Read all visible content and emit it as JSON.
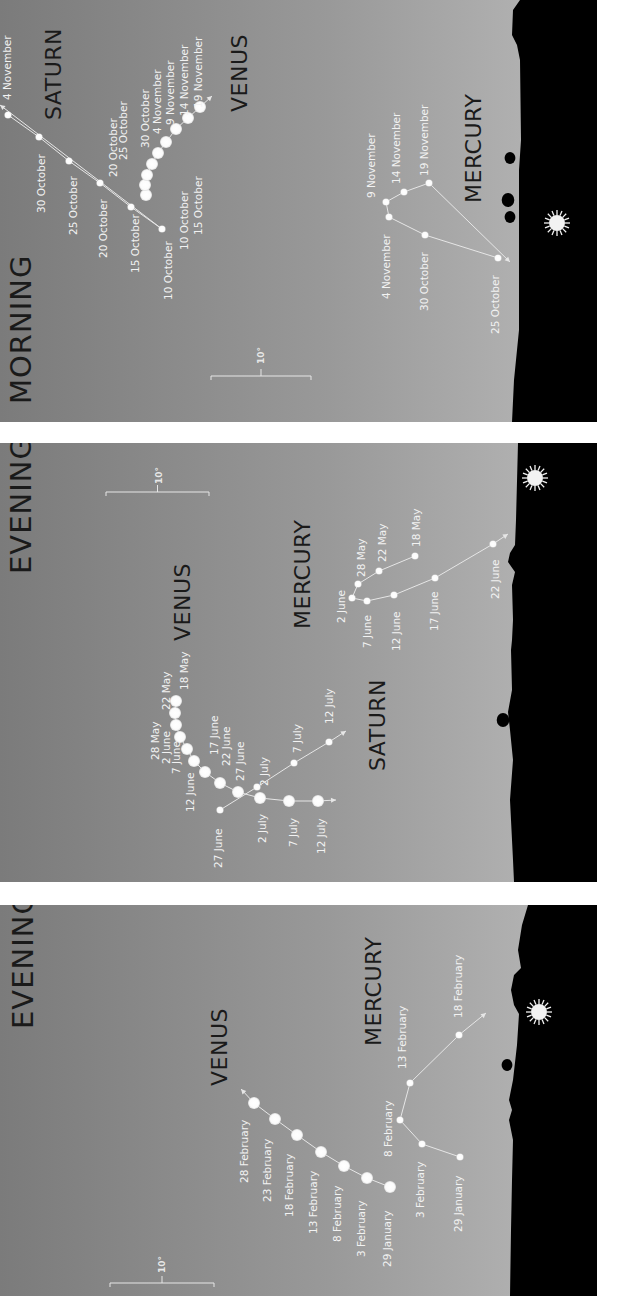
{
  "colors": {
    "sky_dark": "#7b7b7b",
    "sky_light": "#b9b9b9",
    "ground": "#000000",
    "gap": "#f7f7f7",
    "dot": "#ffffff",
    "track": "#e6e6e6",
    "sun": "#f2f2f2"
  },
  "panels": [
    {
      "id": "morning",
      "title": "MORNING",
      "y0": 0,
      "y1": 422,
      "ground_x": 515,
      "title_pos": [
        31,
        404
      ],
      "scale": {
        "label": "10°",
        "x1": 211,
        "x2": 311,
        "y": 376,
        "label_pos": [
          264,
          364
        ]
      },
      "sun": [
        557,
        223
      ],
      "ground_profile": [
        [
          520,
          0
        ],
        [
          513,
          10
        ],
        [
          512,
          35
        ],
        [
          517,
          45
        ],
        [
          520,
          60
        ],
        [
          521,
          140
        ],
        [
          519,
          170
        ],
        [
          519,
          330
        ],
        [
          514,
          380
        ],
        [
          512,
          422
        ]
      ],
      "trees": [
        [
          510,
          158,
          6
        ],
        [
          508,
          200,
          7
        ],
        [
          510,
          217,
          6
        ]
      ],
      "planets": [
        {
          "name": "SATURN",
          "label_pos": [
            61,
            120
          ],
          "dot_r": 3.6,
          "arrow_end": [
            0,
            105
          ],
          "points": [
            {
              "date": "4 November",
              "x": 8,
              "y": 115,
              "lx": 11,
              "ly": 100
            },
            {
              "date": "30 October",
              "x": 39,
              "y": 137,
              "lx": 45,
              "ly": 213
            },
            {
              "date": "25 October",
              "x": 69,
              "y": 161,
              "lx": 77,
              "ly": 235
            },
            {
              "date": "20 October",
              "x": 100,
              "y": 183,
              "lx": 107,
              "ly": 258
            },
            {
              "date": "15 October",
              "x": 131,
              "y": 207,
              "lx": 139,
              "ly": 273
            },
            {
              "date": "10 October",
              "x": 162,
              "y": 229,
              "lx": 172,
              "ly": 300
            }
          ]
        },
        {
          "name": "VENUS",
          "label_pos": [
            247,
            112
          ],
          "dot_r": 6,
          "arrow_end": [
            212,
            96
          ],
          "points": [
            {
              "date": "10 October",
              "x": 146,
              "y": 195,
              "lx": 188,
              "ly": 250
            },
            {
              "date": "15 October",
              "x": 145,
              "y": 185,
              "lx": 202,
              "ly": 235
            },
            {
              "date": "20 October",
              "x": 147,
              "y": 175,
              "lx": 117,
              "ly": 177
            },
            {
              "date": "25 October",
              "x": 152,
              "y": 164,
              "lx": 127,
              "ly": 160
            },
            {
              "date": "30 October",
              "x": 158,
              "y": 153,
              "lx": 149,
              "ly": 148
            },
            {
              "date": "4 November",
              "x": 166,
              "y": 142,
              "lx": 161,
              "ly": 134
            },
            {
              "date": "9 November",
              "x": 176,
              "y": 129,
              "lx": 174,
              "ly": 125
            },
            {
              "date": "14 November",
              "x": 188,
              "y": 118,
              "lx": 188,
              "ly": 116
            },
            {
              "date": "19 November",
              "x": 200,
              "y": 107,
              "lx": 202,
              "ly": 108
            }
          ]
        },
        {
          "name": "MERCURY",
          "label_pos": [
            481,
            203
          ],
          "dot_r": 3.6,
          "arrow_end": [
            510,
            262
          ],
          "points": [
            {
              "date": "25 October",
              "x": 498,
              "y": 258,
              "lx": 499,
              "ly": 334
            },
            {
              "date": "30 October",
              "x": 425,
              "y": 235,
              "lx": 428,
              "ly": 311
            },
            {
              "date": "4 November",
              "x": 389,
              "y": 217,
              "lx": 390,
              "ly": 299
            },
            {
              "date": "9 November",
              "x": 386,
              "y": 202,
              "lx": 375,
              "ly": 198
            },
            {
              "date": "14 November",
              "x": 404,
              "y": 192,
              "lx": 400,
              "ly": 184
            },
            {
              "date": "19 November",
              "x": 429,
              "y": 183,
              "lx": 428,
              "ly": 176
            }
          ],
          "arrow_start": [
            441,
            178
          ]
        }
      ]
    },
    {
      "id": "evening-mid",
      "title": "EVENING",
      "y0": 443,
      "y1": 882,
      "ground_x": 515,
      "title_pos": [
        31,
        574
      ],
      "scale": {
        "label": "10°",
        "x1": 106,
        "x2": 209,
        "y": 492,
        "label_pos": [
          162,
          484
        ]
      },
      "sun": [
        535,
        478
      ],
      "ground_profile": [
        [
          518,
          443
        ],
        [
          516,
          520
        ],
        [
          515,
          545
        ],
        [
          510,
          553
        ],
        [
          508,
          562
        ],
        [
          515,
          572
        ],
        [
          512,
          585
        ],
        [
          513,
          620
        ],
        [
          512,
          640
        ],
        [
          511,
          650
        ],
        [
          512,
          690
        ],
        [
          508,
          712
        ],
        [
          510,
          730
        ],
        [
          513,
          760
        ],
        [
          510,
          800
        ],
        [
          513,
          860
        ],
        [
          514,
          882
        ]
      ],
      "trees": [
        [
          503,
          720,
          7
        ]
      ],
      "planets": [
        {
          "name": "VENUS",
          "label_pos": [
            190,
            641
          ],
          "dot_r": 6,
          "arrow_end": [
            336,
            800
          ],
          "points": [
            {
              "date": "18 May",
              "x": 176,
              "y": 701,
              "lx": 188,
              "ly": 690
            },
            {
              "date": "22 May",
              "x": 175,
              "y": 713,
              "lx": 170,
              "ly": 710
            },
            {
              "date": "28 May",
              "x": 176,
              "y": 725,
              "lx": 159,
              "ly": 760
            },
            {
              "date": "2 June",
              "x": 180,
              "y": 737,
              "lx": 170,
              "ly": 764
            },
            {
              "date": "7 June",
              "x": 187,
              "y": 749,
              "lx": 180,
              "ly": 774
            },
            {
              "date": "12 June",
              "x": 194,
              "y": 761,
              "lx": 194,
              "ly": 812
            },
            {
              "date": "17 June",
              "x": 205,
              "y": 772,
              "lx": 218,
              "ly": 755
            },
            {
              "date": "22 June",
              "x": 220,
              "y": 783,
              "lx": 230,
              "ly": 766
            },
            {
              "date": "27 June",
              "x": 238,
              "y": 792,
              "lx": 244,
              "ly": 781
            },
            {
              "date": "2 July",
              "x": 260,
              "y": 798,
              "lx": 266,
              "ly": 843
            },
            {
              "date": "7 July",
              "x": 289,
              "y": 801,
              "lx": 297,
              "ly": 847
            },
            {
              "date": "12 July",
              "x": 318,
              "y": 801,
              "lx": 325,
              "ly": 854
            }
          ]
        },
        {
          "name": "SATURN",
          "label_pos": [
            385,
            771
          ],
          "dot_r": 3.6,
          "arrow_end": [
            346,
            731
          ],
          "points": [
            {
              "date": "27 June",
              "x": 220,
              "y": 810,
              "lx": 222,
              "ly": 868
            },
            {
              "date": "2 July",
              "x": 257,
              "y": 787,
              "lx": 268,
              "ly": 786
            },
            {
              "date": "7 July",
              "x": 294,
              "y": 763,
              "lx": 301,
              "ly": 753
            },
            {
              "date": "12 July",
              "x": 329,
              "y": 742,
              "lx": 333,
              "ly": 724
            }
          ]
        },
        {
          "name": "MERCURY",
          "label_pos": [
            310,
            629
          ],
          "dot_r": 3.6,
          "arrow_end": [
            508,
            534
          ],
          "points": [
            {
              "date": "18 May",
              "x": 415,
              "y": 556,
              "lx": 420,
              "ly": 547
            },
            {
              "date": "22 May",
              "x": 379,
              "y": 571,
              "lx": 386,
              "ly": 562
            },
            {
              "date": "28 May",
              "x": 358,
              "y": 584,
              "lx": 365,
              "ly": 577
            },
            {
              "date": "2 June",
              "x": 352,
              "y": 598,
              "lx": 345,
              "ly": 623
            },
            {
              "date": "7 June",
              "x": 367,
              "y": 601,
              "lx": 371,
              "ly": 648
            },
            {
              "date": "12 June",
              "x": 394,
              "y": 595,
              "lx": 400,
              "ly": 651
            },
            {
              "date": "17 June",
              "x": 435,
              "y": 578,
              "lx": 438,
              "ly": 631
            },
            {
              "date": "22 June",
              "x": 493,
              "y": 544,
              "lx": 499,
              "ly": 599
            }
          ]
        }
      ]
    },
    {
      "id": "evening-bottom",
      "title": "EVENING",
      "y0": 905,
      "y1": 1296,
      "ground_x": 515,
      "title_pos": [
        33,
        1029
      ],
      "scale": {
        "label": "10°",
        "x1": 110,
        "x2": 214,
        "y": 1283,
        "label_pos": [
          165,
          1273
        ]
      },
      "sun": [
        539,
        1012
      ],
      "ground_profile": [
        [
          528,
          905
        ],
        [
          522,
          925
        ],
        [
          518,
          950
        ],
        [
          521,
          968
        ],
        [
          514,
          975
        ],
        [
          511,
          990
        ],
        [
          514,
          1005
        ],
        [
          519,
          1014
        ],
        [
          517,
          1045
        ],
        [
          513,
          1080
        ],
        [
          509,
          1100
        ],
        [
          512,
          1110
        ],
        [
          509,
          1120
        ],
        [
          513,
          1140
        ],
        [
          512,
          1180
        ],
        [
          511,
          1230
        ],
        [
          510,
          1296
        ]
      ],
      "trees": [
        [
          507,
          1065,
          6
        ]
      ],
      "planets": [
        {
          "name": "VENUS",
          "label_pos": [
            227,
            1086
          ],
          "dot_r": 6,
          "arrow_end": [
            241,
            1089
          ],
          "points": [
            {
              "date": "29 January",
              "x": 390,
              "y": 1187,
              "lx": 391,
              "ly": 1267
            },
            {
              "date": "3 February",
              "x": 367,
              "y": 1178,
              "lx": 365,
              "ly": 1257
            },
            {
              "date": "8 February",
              "x": 344,
              "y": 1166,
              "lx": 341,
              "ly": 1242
            },
            {
              "date": "13 February",
              "x": 321,
              "y": 1152,
              "lx": 317,
              "ly": 1234
            },
            {
              "date": "18 February",
              "x": 297,
              "y": 1135,
              "lx": 293,
              "ly": 1217
            },
            {
              "date": "23 February",
              "x": 275,
              "y": 1119,
              "lx": 271,
              "ly": 1202
            },
            {
              "date": "28 February",
              "x": 254,
              "y": 1103,
              "lx": 248,
              "ly": 1183
            }
          ]
        },
        {
          "name": "MERCURY",
          "label_pos": [
            381,
            1046
          ],
          "dot_r": 3.6,
          "arrow_end": [
            486,
            1013
          ],
          "points": [
            {
              "date": "29 January",
              "x": 460,
              "y": 1157,
              "lx": 462,
              "ly": 1232
            },
            {
              "date": "3 February",
              "x": 422,
              "y": 1144,
              "lx": 424,
              "ly": 1218
            },
            {
              "date": "8 February",
              "x": 400,
              "y": 1120,
              "lx": 392,
              "ly": 1157
            },
            {
              "date": "13 February",
              "x": 410,
              "y": 1083,
              "lx": 406,
              "ly": 1069
            },
            {
              "date": "18 February",
              "x": 459,
              "y": 1035,
              "lx": 462,
              "ly": 1018
            }
          ]
        }
      ]
    }
  ]
}
